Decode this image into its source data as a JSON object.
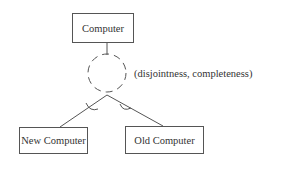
{
  "diagram": {
    "type": "generalization",
    "parent": {
      "label": "Computer"
    },
    "constraint": {
      "label": "(disjointness, completeness)"
    },
    "children": [
      {
        "label": "New Computer"
      },
      {
        "label": "Old Computer"
      }
    ],
    "colors": {
      "stroke": "#555555",
      "text": "#333333",
      "background": "#ffffff"
    }
  }
}
